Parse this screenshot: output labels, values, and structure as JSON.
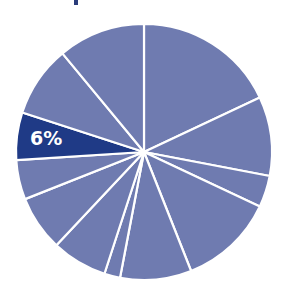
{
  "chart_data": {
    "type": "pie",
    "title": "",
    "start_angle_deg": 0,
    "direction": "clockwise",
    "values": [
      18,
      10,
      4,
      12,
      9,
      2,
      7,
      7,
      5,
      6,
      9,
      11
    ],
    "highlight_index": 9,
    "labels": [
      "",
      "",
      "",
      "",
      "",
      "",
      "",
      "",
      "",
      "6%",
      "",
      ""
    ],
    "colors": {
      "default": "#6f7bb0",
      "highlight": "#1f3a86",
      "separator": "#ffffff"
    },
    "legend": null
  },
  "annotation": {
    "highlight_label": "6%"
  }
}
